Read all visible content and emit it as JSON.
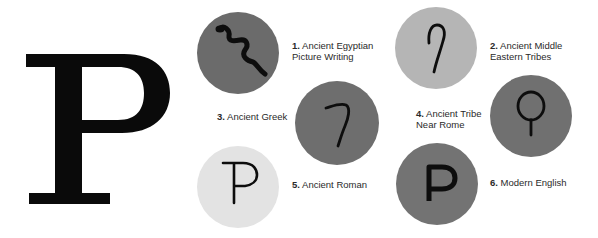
{
  "title_letter": "P",
  "colors": {
    "dark_gray": "#6b6b6b",
    "mid_gray": "#707070",
    "light_gray": "#b5b5b5",
    "pale_gray": "#e3e3e3",
    "ink": "#111111"
  },
  "stages": [
    {
      "num": "1.",
      "line1": "Ancient Egyptian",
      "line2": "Picture Writing",
      "glyph": "snake-glyph"
    },
    {
      "num": "2.",
      "line1": "Ancient Middle",
      "line2": "Eastern Tribes",
      "glyph": "hook-glyph"
    },
    {
      "num": "3.",
      "line1": "Ancient Greek",
      "line2": "",
      "glyph": "greek-pi-glyph"
    },
    {
      "num": "4.",
      "line1": "Ancient Tribe",
      "line2": "Near Rome",
      "glyph": "loop-glyph"
    },
    {
      "num": "5.",
      "line1": "Ancient Roman",
      "line2": "",
      "glyph": "roman-p-glyph"
    },
    {
      "num": "6.",
      "line1": "Modern English",
      "line2": "",
      "glyph": "modern-p-glyph"
    }
  ]
}
